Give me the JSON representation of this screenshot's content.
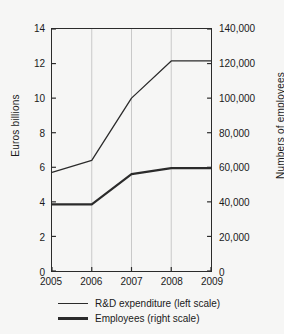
{
  "chart_data": {
    "type": "line",
    "title": "",
    "xlabel": "",
    "categories": [
      "2005",
      "2006",
      "2007",
      "2008",
      "2009"
    ],
    "x": [
      2005,
      2006,
      2007,
      2008,
      2009
    ],
    "grid": "vertical-only",
    "legend_position": "bottom",
    "axes": {
      "left": {
        "label": "Euros billions",
        "min": 0,
        "max": 14,
        "tick_step": 2,
        "ticks": [
          "0",
          "2",
          "4",
          "6",
          "8",
          "10",
          "12",
          "14"
        ],
        "tick_values": [
          0,
          2,
          4,
          6,
          8,
          10,
          12,
          14
        ]
      },
      "right": {
        "label": "Numbers of employees",
        "min": 0,
        "max": 140000,
        "tick_step": 20000,
        "ticks": [
          "0",
          "20,000",
          "40,000",
          "60,000",
          "80,000",
          "100,000",
          "120,000",
          "140,000"
        ],
        "tick_values": [
          0,
          20000,
          40000,
          60000,
          80000,
          100000,
          120000,
          140000
        ]
      }
    },
    "series": [
      {
        "name": "R&D expenditure (left scale)",
        "axis": "left",
        "unit": "Euros billions",
        "values": [
          5.7,
          6.4,
          10.0,
          12.15,
          12.15
        ],
        "color": "#2b2b2b",
        "width": 1.3
      },
      {
        "name": "Employees (right scale)",
        "axis": "right",
        "unit": "Numbers of employees",
        "values": [
          38500,
          38500,
          56000,
          59500,
          59500
        ],
        "color": "#2b2b2b",
        "width": 2.2
      }
    ],
    "legend": [
      {
        "label": "R&D expenditure (left scale)",
        "style": "thin"
      },
      {
        "label": "Employees (right scale)",
        "style": "thick"
      }
    ],
    "colors": {
      "background": "#f6f6f5",
      "axis": "#2b2b2b",
      "gridline": "#c8c8c8",
      "text": "#1a1a1a"
    }
  }
}
